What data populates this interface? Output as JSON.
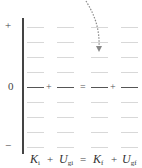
{
  "chart_data": {
    "type": "bar",
    "categories": [
      "K_i",
      "U_gi",
      "K_f",
      "U_gf"
    ],
    "values": [
      null,
      null,
      null,
      null
    ],
    "axis": {
      "plus_label": "+",
      "zero_label": "0",
      "minus_label": "−"
    },
    "grid": true,
    "levels_above_zero": 4,
    "levels_below_zero": 4,
    "annotation": "dotted curved arrow pointing into the K_f column"
  },
  "axis": {
    "plus": "+",
    "zero": "0",
    "minus": "−"
  },
  "equation": {
    "terms": [
      {
        "main": "K",
        "sub": "i"
      },
      {
        "main": "U",
        "sub": "gi"
      },
      {
        "main": "K",
        "sub": "f"
      },
      {
        "main": "U",
        "sub": "gf"
      }
    ],
    "op1": "+",
    "eq": "=",
    "op2": "+"
  },
  "colors": {
    "axis": "#444444",
    "grid": "#d8d8d8",
    "arrow": "#888888"
  }
}
